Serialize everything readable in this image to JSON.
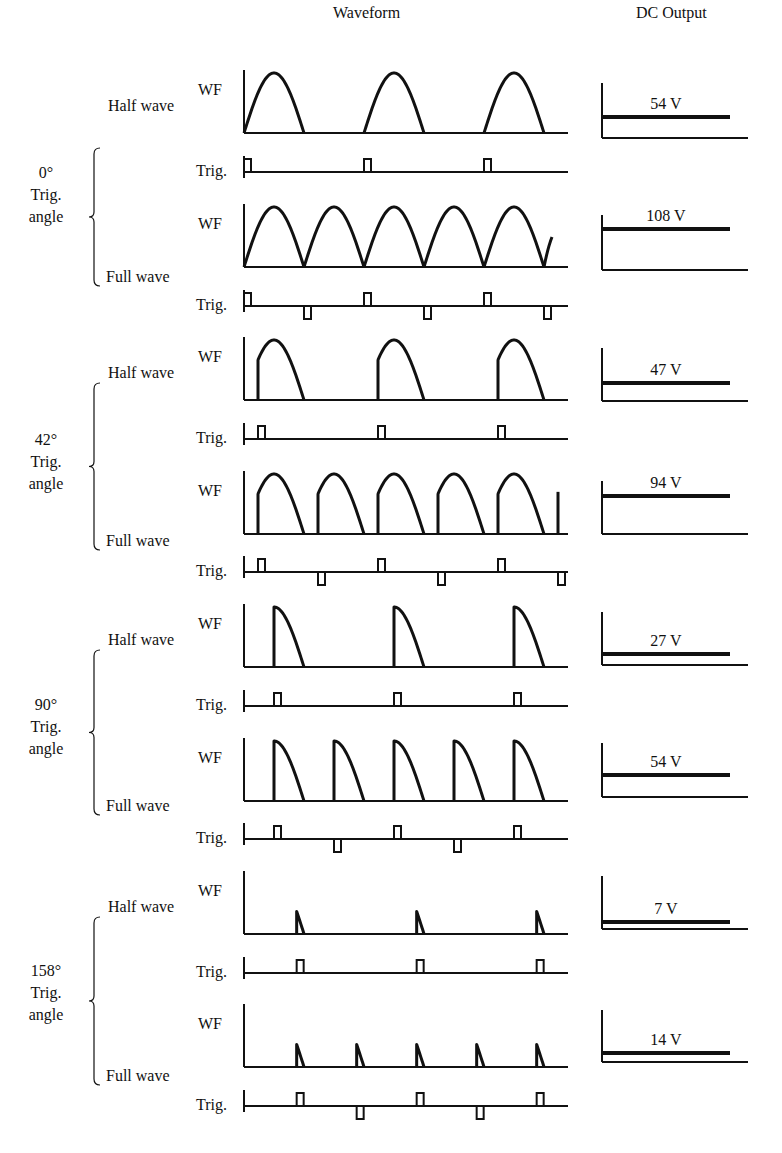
{
  "header": {
    "waveform_title": "Waveform",
    "dc_title": "DC Output"
  },
  "labels": {
    "wf": "WF",
    "trig": "Trig.",
    "half_wave": "Half wave",
    "full_wave": "Full wave",
    "trig_line": "Trig.",
    "angle_line": "angle"
  },
  "groups": [
    {
      "angle": "0°",
      "angle_deg": 0,
      "half": {
        "wf_base": 133,
        "trig_base": 172,
        "dc_top": 83,
        "dc_base": 138,
        "dc_line": 117,
        "dc_label": "54 V"
      },
      "full": {
        "wf_base": 267,
        "trig_base": 306,
        "dc_top": 215,
        "dc_base": 270,
        "dc_line": 229,
        "dc_label": "108 V"
      },
      "label_y": 180,
      "brace": [
        148,
        286
      ]
    },
    {
      "angle": "42°",
      "angle_deg": 42,
      "half": {
        "wf_base": 400,
        "trig_base": 439,
        "dc_top": 348,
        "dc_base": 401,
        "dc_line": 383,
        "dc_label": "47 V"
      },
      "full": {
        "wf_base": 534,
        "trig_base": 572,
        "dc_top": 481,
        "dc_base": 534,
        "dc_line": 496,
        "dc_label": "94 V"
      },
      "label_y": 447,
      "brace": [
        383,
        550
      ]
    },
    {
      "angle": "90°",
      "angle_deg": 90,
      "half": {
        "wf_base": 667,
        "trig_base": 706,
        "dc_top": 612,
        "dc_base": 665,
        "dc_line": 654,
        "dc_label": "27 V"
      },
      "full": {
        "wf_base": 801,
        "trig_base": 839,
        "dc_top": 743,
        "dc_base": 797,
        "dc_line": 775,
        "dc_label": "54 V"
      },
      "label_y": 712,
      "brace": [
        650,
        815
      ]
    },
    {
      "angle": "158°",
      "angle_deg": 158,
      "half": {
        "wf_base": 934,
        "trig_base": 973,
        "dc_top": 876,
        "dc_base": 929,
        "dc_line": 922,
        "dc_label": "7 V"
      },
      "full": {
        "wf_base": 1067,
        "trig_base": 1106,
        "dc_top": 1010,
        "dc_base": 1062,
        "dc_line": 1053,
        "dc_label": "14 V"
      },
      "label_y": 978,
      "brace": [
        917,
        1085
      ]
    }
  ],
  "geometry": {
    "axis_x": 244,
    "axis_end_x": 568,
    "period": 120,
    "half_cycle": 60,
    "amplitude": 60,
    "pulse_w": 7,
    "pulse_h": 13,
    "dc_axis_x": 602,
    "dc_line_end": 730,
    "dc_base_end": 748,
    "colors": {
      "stroke": "#111111",
      "background": "#ffffff"
    }
  },
  "chart_data": {
    "type": "table",
    "columns": [
      "Trigger angle",
      "Rectifier",
      "DC Output"
    ],
    "rows": [
      [
        "0°",
        "Half wave",
        "54 V"
      ],
      [
        "0°",
        "Full wave",
        "108 V"
      ],
      [
        "42°",
        "Half wave",
        "47 V"
      ],
      [
        "42°",
        "Full wave",
        "94 V"
      ],
      [
        "90°",
        "Half wave",
        "27 V"
      ],
      [
        "90°",
        "Full wave",
        "54 V"
      ],
      [
        "158°",
        "Half wave",
        "7 V"
      ],
      [
        "158°",
        "Full wave",
        "14 V"
      ]
    ]
  }
}
